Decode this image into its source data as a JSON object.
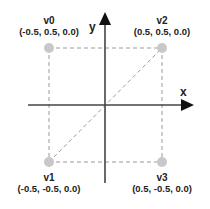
{
  "axes": {
    "x_label": "x",
    "y_label": "y"
  },
  "vertices": [
    {
      "name": "v0",
      "coords": "(-0.5, 0.5, 0.0)"
    },
    {
      "name": "v1",
      "coords": "(-0.5, -0.5, 0.0)"
    },
    {
      "name": "v2",
      "coords": "(0.5, 0.5, 0.0)"
    },
    {
      "name": "v3",
      "coords": "(0.5, -0.5, 0.0)"
    }
  ],
  "colors": {
    "axis": "#444444",
    "dashed": "#9a9a9a",
    "vertex_fill": "#c8c8c8",
    "text": "#222222"
  }
}
